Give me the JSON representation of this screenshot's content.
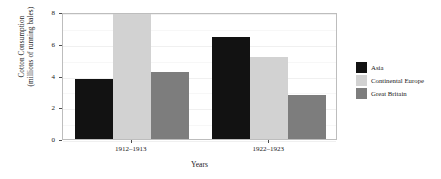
{
  "chart_data": {
    "type": "bar",
    "title": "",
    "xlabel": "Years",
    "ylabel_lines": [
      "Cotton Consumption",
      "(millions of running bales)"
    ],
    "categories": [
      "1912–1913",
      "1922–1923"
    ],
    "series": [
      {
        "name": "Asia",
        "color": "#121212",
        "values": [
          3.75,
          6.45
        ]
      },
      {
        "name": "Continental Europe",
        "color": "#d2d2d2",
        "values": [
          7.85,
          5.15
        ]
      },
      {
        "name": "Great Britain",
        "color": "#7d7d7d",
        "values": [
          4.25,
          2.75
        ]
      }
    ],
    "ylim": [
      0,
      8
    ],
    "yticks": [
      0,
      2,
      4,
      6,
      8
    ],
    "ytick_labels": [
      "0",
      "2",
      "4",
      "6",
      "8"
    ],
    "grid": true,
    "legend_position": "right"
  },
  "legend": {
    "entries": [
      {
        "label": "Asia"
      },
      {
        "label": "Continental Europe"
      },
      {
        "label": "Great Britain"
      }
    ]
  }
}
